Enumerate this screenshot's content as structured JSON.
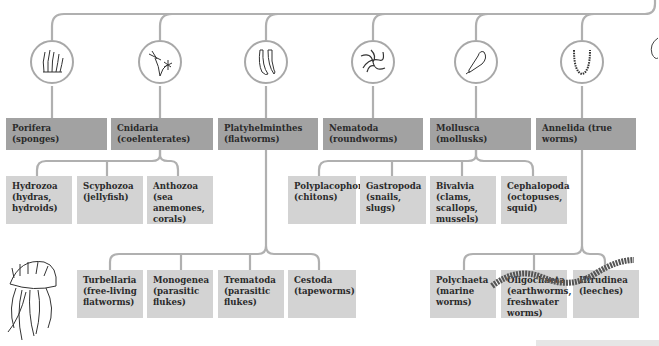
{
  "diagram": {
    "colors": {
      "line": "#b0b0b0",
      "phylum_box": "#a2a2a2",
      "class_box": "#d3d3d3",
      "text": "#2a2a2a"
    },
    "phyla": [
      {
        "label": "Porifera (sponges)",
        "icon": "sponge-icon"
      },
      {
        "label": "Cnidaria (coelenterates)",
        "icon": "hydra-icon"
      },
      {
        "label": "Platyhelminthes (flatworms)",
        "icon": "flatworm-icon"
      },
      {
        "label": "Nematoda (roundworms)",
        "icon": "roundworm-icon"
      },
      {
        "label": "Mollusca (mollusks)",
        "icon": "shell-icon"
      },
      {
        "label": "Annelida (true worms)",
        "icon": "annelid-icon"
      }
    ],
    "cnidaria_classes": [
      {
        "label": "Hydrozoa (hydras, hydroids)"
      },
      {
        "label": "Scyphozoa (jellyfish)"
      },
      {
        "label": "Anthozoa (sea anemones, corals)"
      }
    ],
    "mollusca_classes": [
      {
        "label": "Polyplacophora (chitons)"
      },
      {
        "label": "Gastropoda (snails, slugs)"
      },
      {
        "label": "Bivalvia (clams, scallops, mussels)"
      },
      {
        "label": "Cephalopoda (octopuses, squid)"
      }
    ],
    "platyhelminthes_classes": [
      {
        "label": "Turbellaria (free-living flatworms)"
      },
      {
        "label": "Monogenea (parasitic flukes)"
      },
      {
        "label": "Trematoda (parasitic flukes)"
      },
      {
        "label": "Cestoda (tapeworms)"
      }
    ],
    "annelida_classes": [
      {
        "label": "Polychaeta (marine worms)"
      },
      {
        "label": "Oligochaeta (earthworms, freshwater worms)"
      },
      {
        "label": "Hirudinea (leeches)"
      }
    ],
    "illustrations": [
      "jellyfish-illustration",
      "earthworm-illustration"
    ]
  }
}
